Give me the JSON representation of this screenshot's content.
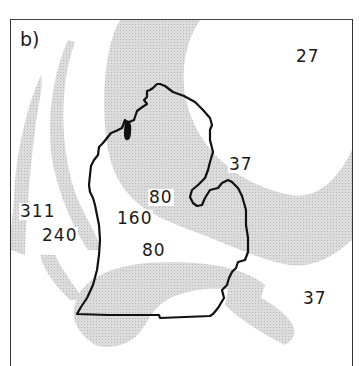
{
  "figure": {
    "panel_label": "b)",
    "region": "Michigan Lower Peninsula",
    "shading_color": "#d4d4d4",
    "outline_color": "#111111"
  },
  "contour_labels": [
    {
      "id": "ne",
      "value": "27"
    },
    {
      "id": "thumb-north",
      "value": "37"
    },
    {
      "id": "center-north",
      "value": "80"
    },
    {
      "id": "center",
      "value": "160"
    },
    {
      "id": "west-far",
      "value": "311"
    },
    {
      "id": "west",
      "value": "240"
    },
    {
      "id": "center-south",
      "value": "80"
    },
    {
      "id": "southeast",
      "value": "37"
    }
  ]
}
